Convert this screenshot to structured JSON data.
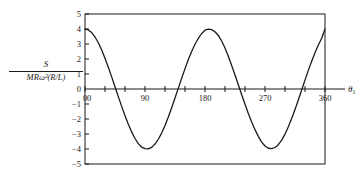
{
  "chart_data": {
    "type": "line",
    "title": "",
    "subtitle": "",
    "xlabel": "θ₁",
    "ylabel_numerator": "S",
    "ylabel_denominator": "MRω²(R/L)",
    "xlim": [
      0,
      360
    ],
    "ylim": [
      -5,
      5
    ],
    "grid": false,
    "legend": "none",
    "xticks": [
      0,
      30,
      60,
      90,
      120,
      150,
      180,
      210,
      240,
      270,
      300,
      330,
      360
    ],
    "xtick_labels": [
      "0",
      "",
      "",
      "90",
      "",
      "",
      "180",
      "",
      "",
      "270",
      "",
      "",
      "360"
    ],
    "yticks": [
      5,
      4,
      3,
      2,
      1,
      0,
      -1,
      -2,
      -3,
      -4,
      -5
    ],
    "ytick_labels": [
      "5",
      "4",
      "3",
      "2",
      "1",
      "0",
      "−1",
      "−2",
      "−3",
      "−4",
      "−5"
    ],
    "origin_label": "0",
    "line_color": "#1a1a1a",
    "frame_color": "#1a1a1a",
    "background": "#ffffff",
    "series": [
      {
        "name": "S/(MRω²(R/L))",
        "x": [
          0,
          5,
          10,
          15,
          20,
          25,
          30,
          35,
          40,
          45,
          50,
          55,
          60,
          65,
          70,
          75,
          80,
          85,
          90,
          95,
          100,
          105,
          110,
          115,
          120,
          125,
          130,
          135,
          140,
          145,
          150,
          155,
          160,
          165,
          170,
          175,
          180,
          185,
          190,
          195,
          200,
          205,
          210,
          215,
          220,
          225,
          230,
          235,
          240,
          245,
          250,
          255,
          260,
          265,
          270,
          275,
          280,
          285,
          290,
          295,
          300,
          305,
          310,
          315,
          320,
          325,
          330,
          335,
          340,
          345,
          350,
          355,
          360
        ],
        "y": [
          4.0,
          3.94,
          3.76,
          3.47,
          3.08,
          2.6,
          2.05,
          1.45,
          0.81,
          0.15,
          -0.51,
          -1.16,
          -1.78,
          -2.35,
          -2.86,
          -3.3,
          -3.64,
          -3.88,
          -3.98,
          -3.99,
          -3.89,
          -3.67,
          -3.35,
          -2.94,
          -2.44,
          -1.87,
          -1.25,
          -0.6,
          0.06,
          0.72,
          1.36,
          1.96,
          2.5,
          2.98,
          3.38,
          3.7,
          3.92,
          3.99,
          3.96,
          3.82,
          3.57,
          3.2,
          2.73,
          2.18,
          1.57,
          0.93,
          0.28,
          -0.38,
          -1.02,
          -1.63,
          -2.2,
          -2.71,
          -3.16,
          -3.54,
          -3.8,
          -3.95,
          -3.98,
          -3.9,
          -3.71,
          -3.41,
          -3.01,
          -2.52,
          -1.97,
          -1.37,
          -0.73,
          -0.07,
          0.59,
          1.24,
          1.85,
          2.42,
          2.93,
          3.38,
          4.0
        ],
        "maxima": [
          {
            "x": 0,
            "y": 4.0
          },
          {
            "x": 183,
            "y": 4.0
          },
          {
            "x": 360,
            "y": 4.0
          }
        ],
        "minima": [
          {
            "x": 93,
            "y": -3.99
          },
          {
            "x": 279,
            "y": -3.98
          }
        ],
        "zero_crossings": [
          46,
          139,
          228,
          326
        ]
      }
    ]
  }
}
